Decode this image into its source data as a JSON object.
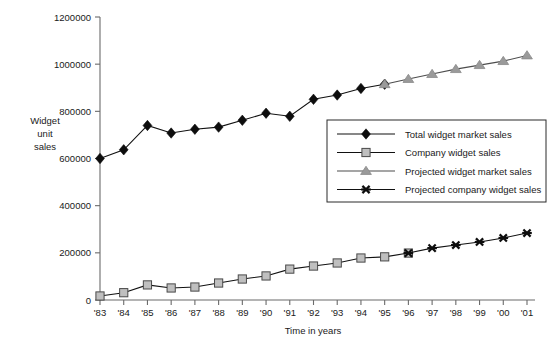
{
  "chart_data": {
    "type": "line",
    "title": "",
    "xlabel": "Time in years",
    "ylabel": "Widget\nunit\nsales",
    "ylabel_lines": [
      "Widget",
      "unit",
      "sales"
    ],
    "x": [
      "'83",
      "'84",
      "'85",
      "'86",
      "'87",
      "'88",
      "'89",
      "'90",
      "'91",
      "'92",
      "'93",
      "'94",
      "'95",
      "'96",
      "'97",
      "'98",
      "'99",
      "'00",
      "'01"
    ],
    "xtick_labels": [
      "'83",
      "'84",
      "'85",
      "'86",
      "'87",
      "'88",
      "'89",
      "'90",
      "'91",
      "'92",
      "'93",
      "'94",
      "'95",
      "'96",
      "'97",
      "'98",
      "'99",
      "'00",
      "'01"
    ],
    "ytick_labels": [
      "0",
      "200000",
      "400000",
      "600000",
      "800000",
      "1000000",
      "1200000"
    ],
    "ytick_values": [
      0,
      200000,
      400000,
      600000,
      800000,
      1000000,
      1200000
    ],
    "ylim": [
      0,
      1200000
    ],
    "xlim": [
      "'83",
      "'01"
    ],
    "grid": false,
    "legend_position": "center-right",
    "series": [
      {
        "name": "Total widget market sales",
        "marker": "diamond",
        "color": "#0d0d0d",
        "x": [
          "'83",
          "'84",
          "'85",
          "'86",
          "'87",
          "'88",
          "'89",
          "'90",
          "'91",
          "'92",
          "'93",
          "'94",
          "'95"
        ],
        "values": [
          600000,
          637000,
          740000,
          708000,
          724000,
          733000,
          762000,
          792000,
          779000,
          851000,
          869000,
          897000,
          915000
        ]
      },
      {
        "name": "Company widget sales",
        "marker": "square",
        "color": "#bfbfbf",
        "x": [
          "'83",
          "'84",
          "'85",
          "'86",
          "'87",
          "'88",
          "'89",
          "'90",
          "'91",
          "'92",
          "'93",
          "'94",
          "'95",
          "'96"
        ],
        "values": [
          17000,
          31000,
          64000,
          51000,
          55000,
          72000,
          89000,
          102000,
          131000,
          144000,
          157000,
          178000,
          183000,
          199000
        ]
      },
      {
        "name": "Projected widget market sales",
        "marker": "triangle",
        "color": "#9a9a9a",
        "x": [
          "'95",
          "'96",
          "'97",
          "'98",
          "'99",
          "'00",
          "'01"
        ],
        "values": [
          915000,
          937000,
          958000,
          979000,
          996000,
          1013000,
          1037000
        ]
      },
      {
        "name": "Projected company widget sales",
        "marker": "x",
        "color": "#0d0d0d",
        "x": [
          "'96",
          "'97",
          "'98",
          "'99",
          "'00",
          "'01"
        ],
        "values": [
          199000,
          220000,
          233000,
          246000,
          263000,
          284000
        ]
      }
    ],
    "legend": [
      {
        "label": "Total widget market sales",
        "marker": "diamond"
      },
      {
        "label": "Company widget sales",
        "marker": "square"
      },
      {
        "label": "Projected widget market sales",
        "marker": "triangle"
      },
      {
        "label": "Projected company widget sales",
        "marker": "x"
      }
    ]
  }
}
